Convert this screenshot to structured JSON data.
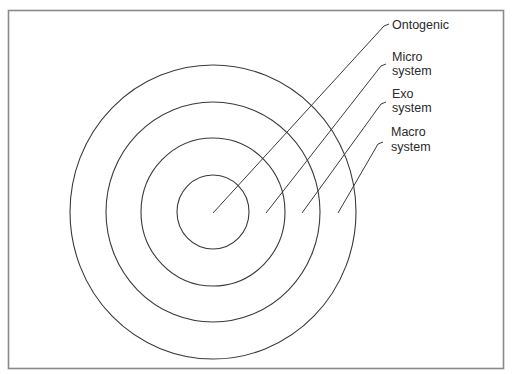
{
  "diagram": {
    "type": "concentric-rings",
    "center": {
      "x": 213,
      "y": 212
    },
    "colors": {
      "frame": "#8a8a8a",
      "line": "#3a3a3a",
      "text": "#2a2a2a",
      "background": "#ffffff"
    },
    "rings": [
      {
        "name": "Ontogenic",
        "rx": 36,
        "ry": 37
      },
      {
        "name": "Micro system",
        "rx": 72,
        "ry": 74
      },
      {
        "name": "Exo system",
        "rx": 107,
        "ry": 110
      },
      {
        "name": "Macro system",
        "rx": 143,
        "ry": 147
      }
    ],
    "labels": [
      {
        "lines": [
          "Ontogenic"
        ]
      },
      {
        "lines": [
          "Micro",
          "system"
        ]
      },
      {
        "lines": [
          "Exo",
          "system"
        ]
      },
      {
        "lines": [
          "Macro",
          "system"
        ]
      }
    ]
  }
}
